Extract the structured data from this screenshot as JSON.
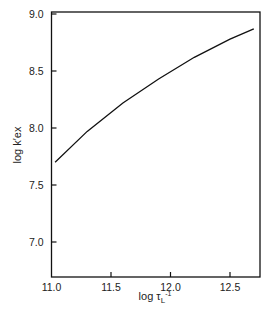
{
  "chart_data": {
    "type": "scatter",
    "title": "",
    "xlabel": "log τL⁻¹",
    "ylabel": "log k′ex",
    "xlim": [
      11.0,
      12.75
    ],
    "ylim": [
      6.69,
      9.0
    ],
    "xticks": [
      11.0,
      11.5,
      12.0,
      12.5
    ],
    "yticks": [
      7.0,
      7.5,
      8.0,
      8.5,
      9.0
    ],
    "xtick_labels": [
      "11.0",
      "11.5",
      "12.0",
      "12.5"
    ],
    "ytick_labels": [
      "7.0",
      "7.5",
      "8.0",
      "8.5",
      "9.0"
    ],
    "grid": false,
    "legend": null,
    "series": [
      {
        "name": "filled-circle",
        "marker": "circle",
        "filled": true,
        "points": [
          {
            "label": "11",
            "x": 11.02,
            "y": 7.6,
            "lx": 0,
            "ly": -9
          },
          {
            "label": "8",
            "x": 11.3,
            "y": 8.13,
            "lx": 0,
            "ly": 10
          },
          {
            "label": "7",
            "x": 11.68,
            "y": 8.29,
            "lx": 0,
            "ly": -7
          },
          {
            "label": "6",
            "x": 11.89,
            "y": 8.39,
            "lx": -2,
            "ly": -7
          },
          {
            "label": "3",
            "x": 12.55,
            "y": 8.75,
            "lx": 7,
            "ly": 3
          },
          {
            "label": "1",
            "x": 12.58,
            "y": 8.95,
            "lx": -7,
            "ly": 6
          }
        ],
        "curve": [
          [
            11.03,
            7.7
          ],
          [
            11.3,
            7.97
          ],
          [
            11.6,
            8.22
          ],
          [
            11.9,
            8.43
          ],
          [
            12.2,
            8.62
          ],
          [
            12.5,
            8.78
          ],
          [
            12.7,
            8.87
          ]
        ]
      },
      {
        "name": "filled-square",
        "marker": "square",
        "filled": true,
        "points": [
          {
            "label": "10",
            "x": 11.22,
            "y": 7.56,
            "lx": -8,
            "ly": -5
          },
          {
            "label": "8",
            "x": 11.3,
            "y": 7.59,
            "lx": 0,
            "ly": 0
          },
          {
            "label": "9",
            "x": 11.3,
            "y": 7.31,
            "lx": 0,
            "ly": -8
          },
          {
            "label": "4",
            "x": 12.27,
            "y": 8.59,
            "lx": 0,
            "ly": 9
          },
          {
            "label": "3",
            "x": 12.54,
            "y": 8.38,
            "lx": -7,
            "ly": 6
          },
          {
            "label": "1",
            "x": 12.61,
            "y": 8.53,
            "lx": -7,
            "ly": 3
          },
          {
            "label": "5",
            "x": 12.65,
            "y": 8.58,
            "lx": 7,
            "ly": -4
          }
        ],
        "curve": [
          [
            11.08,
            7.25
          ],
          [
            11.3,
            7.46
          ],
          [
            11.6,
            7.75
          ],
          [
            11.9,
            8.0
          ],
          [
            12.2,
            8.22
          ],
          [
            12.5,
            8.42
          ],
          [
            12.7,
            8.54
          ]
        ]
      },
      {
        "name": "filled-triangle",
        "marker": "triangle",
        "filled": true,
        "points": [
          {
            "label": "11",
            "x": 11.03,
            "y": 6.79,
            "lx": 0,
            "ly": -8
          },
          {
            "label": "10",
            "x": 11.22,
            "y": 7.08,
            "lx": -8,
            "ly": -4
          },
          {
            "label": "8",
            "x": 11.3,
            "y": 7.52,
            "lx": 6,
            "ly": 4
          },
          {
            "label": "7",
            "x": 11.68,
            "y": 7.39,
            "lx": 0,
            "ly": -8
          },
          {
            "label": "6",
            "x": 11.88,
            "y": 7.51,
            "lx": 0,
            "ly": -8
          },
          {
            "label": "3",
            "x": 12.55,
            "y": 7.68,
            "lx": -7,
            "ly": 3
          },
          {
            "label": "2",
            "x": 12.61,
            "y": 7.85,
            "lx": -7,
            "ly": 3
          },
          {
            "label": "1",
            "x": 12.62,
            "y": 7.91,
            "lx": 7,
            "ly": -1
          }
        ],
        "curve": [
          [
            11.05,
            6.93
          ],
          [
            11.3,
            7.14
          ],
          [
            11.6,
            7.36
          ],
          [
            11.9,
            7.53
          ],
          [
            12.2,
            7.64
          ],
          [
            12.5,
            7.73
          ],
          [
            12.7,
            7.77
          ]
        ]
      },
      {
        "name": "open-triangle",
        "marker": "triangle",
        "filled": false,
        "points": [
          {
            "label": "9",
            "x": 11.3,
            "y": 7.14,
            "lx": 7,
            "ly": 0
          },
          {
            "label": "8",
            "x": 11.3,
            "y": 7.08,
            "lx": 0,
            "ly": 9
          },
          {
            "label": "7",
            "x": 11.7,
            "y": 6.92,
            "lx": 0,
            "ly": -8
          },
          {
            "label": "3",
            "x": 12.58,
            "y": 7.29,
            "lx": -10,
            "ly": 0
          },
          {
            "label": "1",
            "x": 12.66,
            "y": 7.28,
            "lx": 7,
            "ly": 2
          },
          {
            "label": "5",
            "x": 12.65,
            "y": 7.3,
            "lx": 0,
            "ly": 0
          }
        ]
      },
      {
        "name": "open-square",
        "marker": "square",
        "filled": false,
        "points": [
          {
            "label": "8",
            "x": 11.3,
            "y": 6.92,
            "lx": 7,
            "ly": 3
          },
          {
            "label": "9",
            "x": 11.3,
            "y": 6.81,
            "lx": 7,
            "ly": 2
          },
          {
            "label": "4",
            "x": 12.27,
            "y": 7.27,
            "lx": 0,
            "ly": 8
          },
          {
            "label": "3",
            "x": 12.54,
            "y": 7.14,
            "lx": 0,
            "ly": 0
          },
          {
            "label": "2",
            "x": 12.6,
            "y": 7.07,
            "lx": -7,
            "ly": 3
          },
          {
            "label": "1",
            "x": 12.61,
            "y": 6.98,
            "lx": 0,
            "ly": 9
          },
          {
            "label": "5",
            "x": 12.65,
            "y": 7.34,
            "lx": -7,
            "ly": 2
          }
        ],
        "curve": [
          [
            11.03,
            6.83
          ],
          [
            11.3,
            6.93
          ],
          [
            11.6,
            7.02
          ],
          [
            11.9,
            7.07
          ],
          [
            12.2,
            7.11
          ],
          [
            12.5,
            7.14
          ],
          [
            12.7,
            7.15
          ]
        ]
      }
    ]
  },
  "colors": {
    "ink": "#111111",
    "background": "#ffffff",
    "tick_text": "#333333"
  }
}
